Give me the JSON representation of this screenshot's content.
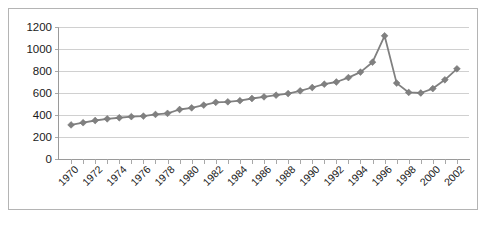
{
  "figure": {
    "caption": "",
    "border_color": "#b4b4b4",
    "background": "#ffffff"
  },
  "chart_data": {
    "type": "line",
    "title": "",
    "subtitle": "",
    "xlabel": "",
    "ylabel": "",
    "series_color": "#808080",
    "marker": "diamond",
    "grid": "horizontal",
    "legend": "none",
    "xlim": [
      1969,
      2003
    ],
    "ylim": [
      0,
      1200
    ],
    "y_ticks": [
      0,
      200,
      400,
      600,
      800,
      1000,
      1200
    ],
    "y_tick_labels": [
      "0",
      "200",
      "400",
      "600",
      "800",
      "1000",
      "1200"
    ],
    "x_tick_labels": [
      "1970",
      "1972",
      "1974",
      "1976",
      "1978",
      "1980",
      "1982",
      "1984",
      "1986",
      "1988",
      "1990",
      "1992",
      "1994",
      "1996",
      "1998",
      "2000",
      "2002"
    ],
    "x_tick_label_rotation": 45,
    "x_minor_tick_interval": 1,
    "x": [
      1970,
      1971,
      1972,
      1973,
      1974,
      1975,
      1976,
      1977,
      1978,
      1979,
      1980,
      1981,
      1982,
      1983,
      1984,
      1985,
      1986,
      1987,
      1988,
      1989,
      1990,
      1991,
      1992,
      1993,
      1994,
      1995,
      1996,
      1997,
      1998,
      1999,
      2000,
      2001,
      2002
    ],
    "values": [
      310,
      330,
      350,
      365,
      375,
      385,
      390,
      405,
      415,
      450,
      465,
      490,
      515,
      520,
      530,
      550,
      565,
      580,
      595,
      620,
      650,
      680,
      700,
      740,
      790,
      880,
      1120,
      690,
      605,
      600,
      640,
      720,
      820
    ],
    "annotations": []
  }
}
